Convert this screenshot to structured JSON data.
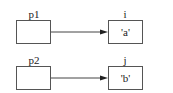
{
  "diagram": {
    "rows": [
      {
        "pointer": {
          "label": "p1"
        },
        "target": {
          "label": "i",
          "value": "'a'"
        }
      },
      {
        "pointer": {
          "label": "p2"
        },
        "target": {
          "label": "j",
          "value": "'b'"
        }
      }
    ],
    "colors": {
      "stroke": "#555555",
      "background": "#ffffff"
    }
  }
}
